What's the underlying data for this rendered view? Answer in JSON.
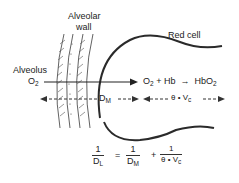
{
  "diagram": {
    "labels": {
      "alveolar_wall_line1": "Alveolar",
      "alveolar_wall_line2": "wall",
      "red_cell": "Red cell",
      "alveolus": "Alveolus",
      "o2_left": "O",
      "o2_left_sub": "2",
      "reaction_o2": "O",
      "reaction_o2_sub": "2",
      "reaction_plus_hb": " + Hb  →  HbO",
      "reaction_hbo2_sub": "2",
      "dm": "D",
      "dm_sub": "M",
      "theta_vc": "θ • V",
      "theta_vc_sub": "c"
    },
    "equation": {
      "lhs_num": "1",
      "lhs_den": "D",
      "lhs_den_sub": "L",
      "equals": "=",
      "term1_num": "1",
      "term1_den": "D",
      "term1_den_sub": "M",
      "plus": "+",
      "term2_num": "1",
      "term2_den": "θ • V",
      "term2_den_sub": "c"
    },
    "colors": {
      "line": "#2a2a2a",
      "text": "#222222"
    }
  }
}
